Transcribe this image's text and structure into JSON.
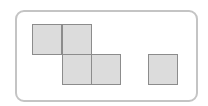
{
  "diagram": {
    "frame": {
      "border_color": "#c4c4c4",
      "background": "#ffffff"
    },
    "square_style": {
      "fill": "#dcdcdc",
      "stroke": "#8c8c8c"
    },
    "groups": [
      {
        "name": "z-shape",
        "squares": [
          {
            "col": 0,
            "row": 0,
            "x": 32,
            "y": 24
          },
          {
            "col": 1,
            "row": 0,
            "x": 62,
            "y": 24
          },
          {
            "col": 1,
            "row": 1,
            "x": 62,
            "y": 54
          },
          {
            "col": 2,
            "row": 1,
            "x": 91,
            "y": 54
          }
        ]
      },
      {
        "name": "single",
        "squares": [
          {
            "col": 0,
            "row": 0,
            "x": 148,
            "y": 54
          }
        ]
      }
    ]
  }
}
